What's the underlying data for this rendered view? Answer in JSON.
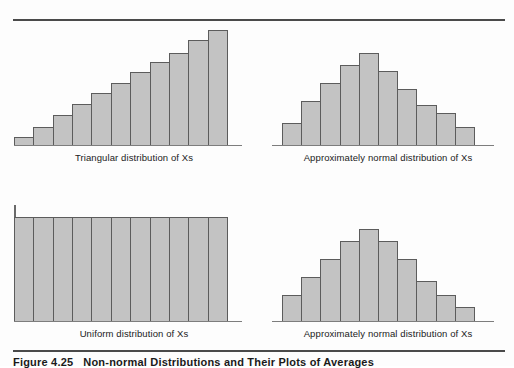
{
  "figure": {
    "title_number": "Figure 4.25",
    "title_text": "Non-normal Distributions and Their Plots of Averages",
    "accent_bar_fill": "#c3c3c3",
    "accent_bar_stroke": "#5c5c5c",
    "rule_color": "#4a4a4a"
  },
  "panels": [
    {
      "id": "triangular",
      "caption": "Triangular distribution of Xs"
    },
    {
      "id": "normal-top",
      "caption": "Approximately normal distribution of Xs"
    },
    {
      "id": "uniform",
      "caption": "Uniform distribution of Xs"
    },
    {
      "id": "normal-bottom",
      "caption": "Approximately normal distribution of Xs"
    }
  ],
  "chart_data": [
    {
      "type": "bar",
      "title": "Triangular distribution of Xs",
      "xlabel": "",
      "ylabel": "",
      "grid": false,
      "legend": "none",
      "categories": [
        "1",
        "2",
        "3",
        "4",
        "5",
        "6",
        "7",
        "8",
        "9",
        "10",
        "11"
      ],
      "values": [
        8,
        18,
        30,
        41,
        52,
        62,
        73,
        83,
        92,
        105,
        115
      ],
      "ylim": [
        0,
        122
      ],
      "bar_count": 11
    },
    {
      "type": "bar",
      "title": "Approximately normal distribution of Xs",
      "xlabel": "",
      "ylabel": "",
      "grid": false,
      "legend": "none",
      "categories": [
        "1",
        "2",
        "3",
        "4",
        "5",
        "6",
        "7",
        "8",
        "9",
        "10"
      ],
      "values": [
        22,
        44,
        62,
        80,
        92,
        74,
        56,
        40,
        32,
        18
      ],
      "ylim": [
        0,
        122
      ],
      "bar_count": 10
    },
    {
      "type": "bar",
      "title": "Uniform distribution of Xs",
      "xlabel": "",
      "ylabel": "",
      "grid": false,
      "legend": "none",
      "categories": [
        "1",
        "2",
        "3",
        "4",
        "5",
        "6",
        "7",
        "8",
        "9",
        "10",
        "11"
      ],
      "values": [
        104,
        104,
        104,
        104,
        104,
        104,
        104,
        104,
        104,
        104,
        104
      ],
      "ylim": [
        0,
        122
      ],
      "bar_count": 11
    },
    {
      "type": "bar",
      "title": "Approximately normal distribution of Xs",
      "xlabel": "",
      "ylabel": "",
      "grid": false,
      "legend": "none",
      "categories": [
        "1",
        "2",
        "3",
        "4",
        "5",
        "6",
        "7",
        "8",
        "9",
        "10"
      ],
      "values": [
        26,
        44,
        62,
        80,
        92,
        80,
        62,
        40,
        26,
        14
      ],
      "ylim": [
        0,
        122
      ],
      "bar_count": 10
    }
  ]
}
